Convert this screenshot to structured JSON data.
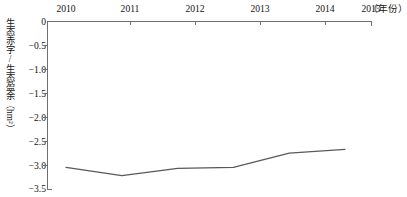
{
  "chart_data": {
    "type": "line",
    "title": "",
    "xlabel": "（年份）",
    "ylabel": "生态赤字/生态盈余（hm²）",
    "ylabel_text": "生态赤字/生态盈余",
    "ylabel_unit": "（hm²）",
    "categories": [
      "2010",
      "2011",
      "2012",
      "2013",
      "2014",
      "2015"
    ],
    "x": [
      2010,
      2011,
      2012,
      2013,
      2014,
      2015
    ],
    "values": [
      -3.05,
      -3.22,
      -3.07,
      -3.05,
      -2.75,
      -2.67
    ],
    "series": [
      {
        "name": "生态赤字/生态盈余",
        "values": [
          -3.05,
          -3.22,
          -3.07,
          -3.05,
          -2.75,
          -2.67
        ]
      }
    ],
    "ylim": [
      -3.5,
      0
    ],
    "xlim": [
      2010,
      2015
    ],
    "yticks": [
      0,
      -0.5,
      -1.0,
      -1.5,
      -2.0,
      -2.5,
      -3.0,
      -3.5
    ],
    "ytick_labels": [
      "0",
      "−0.5",
      "−1.0",
      "−1.5",
      "−2.0",
      "−2.5",
      "−3.0",
      "−3.5"
    ],
    "xtick_labels": [
      "2010",
      "2011",
      "2012",
      "2013",
      "2014",
      "2015"
    ],
    "grid": false,
    "legend": "none",
    "xaxis_position": "top",
    "line_color": "#58595b",
    "axis_color": "#6f6f6f"
  },
  "axes": {
    "x_unit_label": "（年份）",
    "y_title_main": "生态赤字/生态盈余",
    "y_title_unit": "（hm²）"
  }
}
